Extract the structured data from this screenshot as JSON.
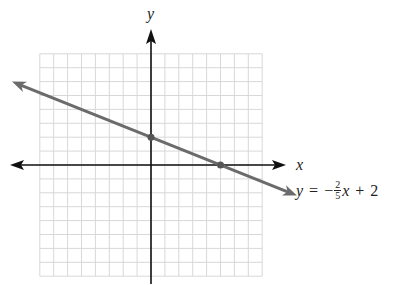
{
  "chart_data": {
    "type": "line",
    "title": "",
    "xlabel": "x",
    "ylabel": "y",
    "xlim": [
      -8,
      8
    ],
    "ylim": [
      -8,
      8
    ],
    "grid": true,
    "grid_step": 1,
    "series": [
      {
        "name": "y = -2/5 x + 2",
        "slope": -0.4,
        "intercept": 2,
        "x": [
          -10,
          10.5
        ],
        "y": [
          6,
          -2.2
        ],
        "color": "#6b6b6b",
        "arrows": "both"
      }
    ],
    "points": [
      {
        "label": "y-intercept",
        "x": 0,
        "y": 2
      },
      {
        "label": "x-intercept",
        "x": 5,
        "y": 0
      }
    ],
    "annotations": [
      {
        "text": "y = -2/5 x + 2",
        "near": "right end of line"
      }
    ]
  },
  "labels": {
    "x_axis": "x",
    "y_axis": "y",
    "equation": {
      "lhs": "y",
      "equals": "=",
      "minus": "−",
      "frac_num": "2",
      "frac_den": "5",
      "var": "x",
      "plus": "+",
      "constant": "2"
    }
  },
  "colors": {
    "axis": "#111111",
    "grid": "#d8d8d8",
    "line": "#6b6b6b",
    "point": "#555555"
  }
}
